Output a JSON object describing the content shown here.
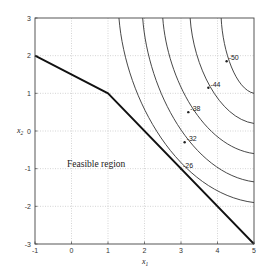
{
  "chart_data": {
    "type": "line",
    "title": "",
    "xlabel": "x1",
    "ylabel": "x2",
    "xlim": [
      -1,
      5
    ],
    "ylim": [
      -3,
      3
    ],
    "grid": true,
    "x_ticks": [
      "-1",
      "0",
      "1",
      "2",
      "3",
      "4",
      "5"
    ],
    "y_ticks": [
      "-3",
      "-2",
      "-1",
      "0",
      "1",
      "2",
      "3"
    ],
    "constraint_boundary": {
      "name": "Feasible region boundary",
      "points": [
        [
          -1,
          2
        ],
        [
          1,
          1
        ],
        [
          5,
          -3
        ]
      ]
    },
    "contours": [
      {
        "level": -26,
        "label": "-26",
        "top_x1": 1.3,
        "right_x2": -1.9,
        "label_at": [
          3.0,
          -1.0
        ]
      },
      {
        "level": -32,
        "label": "-32",
        "top_x1": 1.95,
        "right_x2": -1.35,
        "label_at": [
          3.1,
          -0.3
        ]
      },
      {
        "level": -38,
        "label": "-38",
        "top_x1": 2.5,
        "right_x2": -0.6,
        "label_at": [
          3.2,
          0.5
        ]
      },
      {
        "level": -44,
        "label": "-44",
        "top_x1": 3.25,
        "right_x2": 0.2,
        "label_at": [
          3.75,
          1.15
        ]
      },
      {
        "level": -50,
        "label": "-50",
        "top_x1": 4.1,
        "right_x2": 1.0,
        "label_at": [
          4.25,
          1.85
        ]
      }
    ],
    "annotations": [
      {
        "text": "Feasible region",
        "at": [
          1.4,
          -0.95
        ]
      }
    ]
  },
  "labels": {
    "xlabel": "x",
    "xlabel_sub": "1",
    "ylabel": "x",
    "ylabel_sub": "2",
    "region": "Feasible region"
  }
}
